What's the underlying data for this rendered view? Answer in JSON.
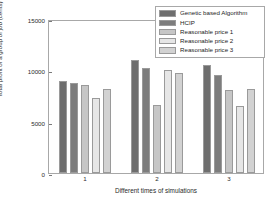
{
  "chart_data": {
    "type": "bar",
    "title": "",
    "xlabel": "Different times of simulations",
    "ylabel": "Total profit of a group of job (cents)",
    "categories": [
      "1",
      "2",
      "3"
    ],
    "xtick_labels": [
      "1",
      "2",
      "3"
    ],
    "ytick_labels": [
      "0",
      "5000",
      "10000",
      "15000"
    ],
    "ytick_values": [
      0,
      5000,
      10000,
      15000
    ],
    "ylim": [
      0,
      15000
    ],
    "grid": false,
    "legend_position": "upper right",
    "series": [
      {
        "name": "Genetic based Algorithm",
        "color": "#6e6e6e",
        "values": [
          9000,
          11000,
          10500
        ]
      },
      {
        "name": "HCIP",
        "color": "#7d7d7d",
        "values": [
          8800,
          10200,
          9550
        ]
      },
      {
        "name": "Reasonable price 1",
        "color": "#c6c6c6",
        "values": [
          8600,
          6650,
          8050
        ]
      },
      {
        "name": "Reasonable price 2",
        "color": "#e6e6e6",
        "values": [
          7300,
          10000,
          6550
        ]
      },
      {
        "name": "Reasonable price 3",
        "color": "#d2d2d2",
        "values": [
          8200,
          9750,
          8200
        ]
      }
    ]
  }
}
